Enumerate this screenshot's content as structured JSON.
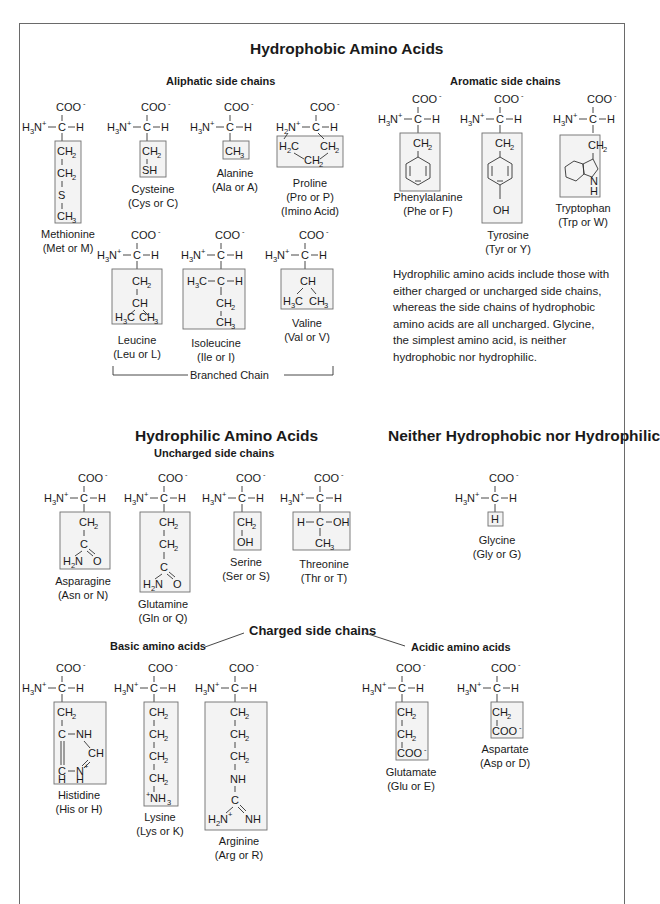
{
  "headings": {
    "hydrophobic": "Hydrophobic Amino Acids",
    "aliphatic": "Aliphatic side chains",
    "aromatic": "Aromatic side chains",
    "hydrophilic": "Hydrophilic Amino Acids",
    "uncharged": "Uncharged side chains",
    "neither": "Neither Hydrophobic nor Hydrophilic",
    "charged": "Charged side chains",
    "basic": "Basic amino acids",
    "acidic": "Acidic amino acids",
    "branched": "Branched Chain"
  },
  "note": "Hydrophilic amino acids include those with either charged or uncharged side chains, whereas the side chains of hydrophobic amino acids are all uncharged. Glycine, the simplest amino acid, is neither hydrophobic nor hydrophilic.",
  "amino_acids": {
    "methionine": {
      "name": "Methionine",
      "code": "(Met or M)",
      "group": "hydrophobic-aliphatic",
      "side_chain": [
        "CH2",
        "CH2",
        "S",
        "CH3"
      ]
    },
    "cysteine": {
      "name": "Cysteine",
      "code": "(Cys or C)",
      "group": "hydrophobic-aliphatic",
      "side_chain": [
        "CH2",
        "SH"
      ]
    },
    "alanine": {
      "name": "Alanine",
      "code": "(Ala or A)",
      "group": "hydrophobic-aliphatic",
      "side_chain": [
        "CH3"
      ]
    },
    "proline": {
      "name": "Proline",
      "code": "(Pro or P)",
      "extra": "(Imino Acid)",
      "group": "hydrophobic-aliphatic",
      "side_chain": [
        "H2C",
        "CH2",
        "CH2"
      ]
    },
    "leucine": {
      "name": "Leucine",
      "code": "(Leu or L)",
      "group": "hydrophobic-aliphatic-branched",
      "side_chain": [
        "CH2",
        "CH",
        "H3C",
        "CH3"
      ]
    },
    "isoleucine": {
      "name": "Isoleucine",
      "code": "(Ile or I)",
      "group": "hydrophobic-aliphatic-branched",
      "side_chain": [
        "H3C-C-H",
        "CH2",
        "CH3"
      ]
    },
    "valine": {
      "name": "Valine",
      "code": "(Val or V)",
      "group": "hydrophobic-aliphatic-branched",
      "side_chain": [
        "CH",
        "H3C",
        "CH3"
      ]
    },
    "phenylalanine": {
      "name": "Phenylalanine",
      "code": "(Phe or F)",
      "group": "hydrophobic-aromatic",
      "side_chain": [
        "CH2",
        "phenyl"
      ]
    },
    "tyrosine": {
      "name": "Tyrosine",
      "code": "(Tyr or Y)",
      "group": "hydrophobic-aromatic",
      "side_chain": [
        "CH2",
        "phenyl",
        "OH"
      ]
    },
    "tryptophan": {
      "name": "Tryptophan",
      "code": "(Trp or W)",
      "group": "hydrophobic-aromatic",
      "side_chain": [
        "CH2",
        "indole",
        "NH"
      ]
    },
    "asparagine": {
      "name": "Asparagine",
      "code": "(Asn or N)",
      "group": "hydrophilic-uncharged",
      "side_chain": [
        "CH2",
        "C",
        "H2N",
        "O"
      ]
    },
    "glutamine": {
      "name": "Glutamine",
      "code": "(Gln or Q)",
      "group": "hydrophilic-uncharged",
      "side_chain": [
        "CH2",
        "CH2",
        "C",
        "H2N",
        "O"
      ]
    },
    "serine": {
      "name": "Serine",
      "code": "(Ser or S)",
      "group": "hydrophilic-uncharged",
      "side_chain": [
        "CH2",
        "OH"
      ]
    },
    "threonine": {
      "name": "Threonine",
      "code": "(Thr or T)",
      "group": "hydrophilic-uncharged",
      "side_chain": [
        "H-C-OH",
        "CH3"
      ]
    },
    "glycine": {
      "name": "Glycine",
      "code": "(Gly or G)",
      "group": "neither",
      "side_chain": [
        "H"
      ]
    },
    "histidine": {
      "name": "Histidine",
      "code": "(His or H)",
      "group": "charged-basic",
      "side_chain": [
        "CH2",
        "C-NH",
        "CH",
        "C-N+",
        "H H"
      ]
    },
    "lysine": {
      "name": "Lysine",
      "code": "(Lys or K)",
      "group": "charged-basic",
      "side_chain": [
        "CH2",
        "CH2",
        "CH2",
        "CH2",
        "+NH3"
      ]
    },
    "arginine": {
      "name": "Arginine",
      "code": "(Arg or R)",
      "group": "charged-basic",
      "side_chain": [
        "CH2",
        "CH2",
        "CH2",
        "NH",
        "C",
        "H2N+",
        "NH"
      ]
    },
    "glutamate": {
      "name": "Glutamate",
      "code": "(Glu or E)",
      "group": "charged-acidic",
      "side_chain": [
        "CH2",
        "CH2",
        "COO-"
      ]
    },
    "aspartate": {
      "name": "Aspartate",
      "code": "(Asp or D)",
      "group": "charged-acidic",
      "side_chain": [
        "CH2",
        "COO-"
      ]
    }
  },
  "backbone": {
    "carboxyl": "COO",
    "amino": "H",
    "alpha": "C",
    "h": "H"
  },
  "colors": {
    "frame": "#6a6a6a",
    "box_fill": "#f3f3f3",
    "box_border": "#6f6f6f",
    "text": "#1a1a1a"
  }
}
